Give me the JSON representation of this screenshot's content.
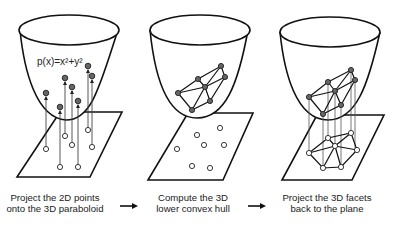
{
  "panels": [
    {
      "id": "step1",
      "equation": "p(x)=x²+y²",
      "caption_line1": "Project the 2D points",
      "caption_line2": "onto the 3D paraboloid"
    },
    {
      "id": "step2",
      "caption_line1": "Compute the 3D",
      "caption_line2": "lower convex hull"
    },
    {
      "id": "step3",
      "caption_line1": "Project the 3D facets",
      "caption_line2": "back to the plane"
    }
  ],
  "arrows": [
    "right-arrow",
    "right-arrow"
  ],
  "colors": {
    "stroke": "#111111",
    "lifted_point_fill": "#666666",
    "plane_point_fill": "#ffffff",
    "text": "#222222"
  }
}
